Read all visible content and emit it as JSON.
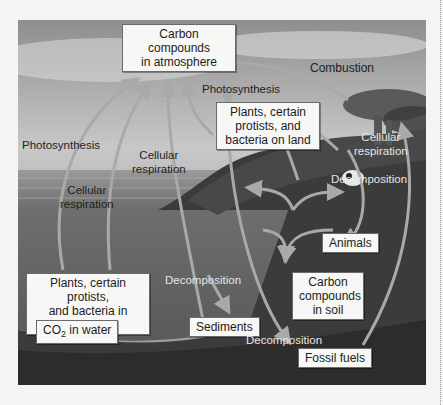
{
  "diagram": {
    "nodes": {
      "atmosphere": "Carbon compounds\nin atmosphere",
      "plants_land": "Plants, certain\nprotists, and\nbacteria on land",
      "plants_water": "Plants, certain protists,\nand bacteria in water",
      "co2_water_prefix": "CO",
      "co2_water_sub": "2",
      "co2_water_suffix": " in water",
      "sediments": "Sediments",
      "animals": "Animals",
      "soil": "Carbon\ncompounds\nin soil",
      "fossil_fuels": "Fossil fuels"
    },
    "processes": {
      "combustion": "Combustion",
      "photosynthesis_top": "Photosynthesis",
      "photosynthesis_left": "Photosynthesis",
      "cellular_respiration_left": "Cellular\nrespiration",
      "cellular_respiration_mid": "Cellular\nrespiration",
      "cellular_respiration_right": "Cellular\nrespiration",
      "decomposition_land": "Decomposition",
      "decomposition_water": "Decomposition",
      "decomposition_soil": "Decomposition"
    },
    "colors": {
      "arrow": "#a9a9a9",
      "box_bg": "#f7f7f5",
      "sky": "#b9b9b9",
      "water": "#6f6f6f",
      "land": "#3a3a3a"
    }
  }
}
